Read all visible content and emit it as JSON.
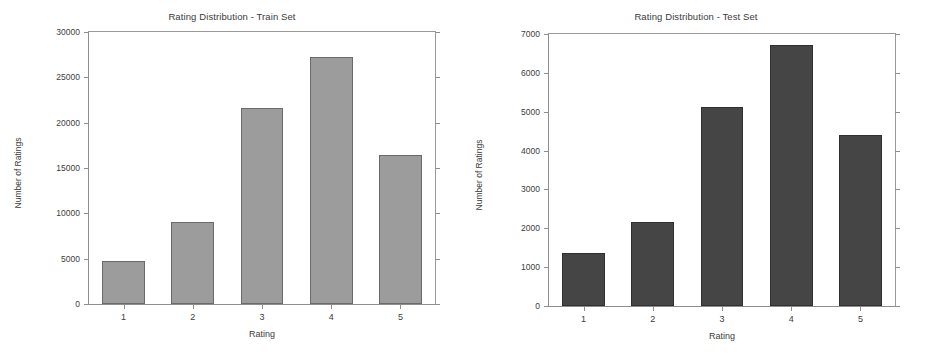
{
  "figure": {
    "background": "#ffffff",
    "panels": [
      "train",
      "test"
    ]
  },
  "chart_data": [
    {
      "type": "bar",
      "panel": "train",
      "title": "Rating Distribution - Train Set",
      "xlabel": "Rating",
      "ylabel": "Number of Ratings",
      "categories": [
        "1",
        "2",
        "3",
        "4",
        "5"
      ],
      "values": [
        4700,
        9100,
        21600,
        27200,
        16450
      ],
      "ylim": [
        0,
        30000
      ],
      "yticks": [
        0,
        5000,
        10000,
        15000,
        20000,
        25000,
        30000
      ],
      "yticklabels": [
        "0",
        "5000",
        "10000",
        "15000",
        "20000",
        "25000",
        "30000"
      ],
      "xticklabels": [
        "1",
        "2",
        "3",
        "4",
        "5"
      ],
      "bar_color": "#9c9c9c",
      "bar_edge_color": "#6a6a6a",
      "grid": false,
      "legend": null
    },
    {
      "type": "bar",
      "panel": "test",
      "title": "Rating Distribution - Test Set",
      "xlabel": "Rating",
      "ylabel": "Number of Ratings",
      "categories": [
        "1",
        "2",
        "3",
        "4",
        "5"
      ],
      "values": [
        1360,
        2170,
        5130,
        6720,
        4400
      ],
      "ylim": [
        0,
        7000
      ],
      "yticks": [
        0,
        1000,
        2000,
        3000,
        4000,
        5000,
        6000,
        7000
      ],
      "yticklabels": [
        "0",
        "1000",
        "2000",
        "3000",
        "4000",
        "5000",
        "6000",
        "7000"
      ],
      "xticklabels": [
        "1",
        "2",
        "3",
        "4",
        "5"
      ],
      "bar_color": "#454545",
      "bar_edge_color": "#303030",
      "grid": false,
      "legend": null
    }
  ]
}
